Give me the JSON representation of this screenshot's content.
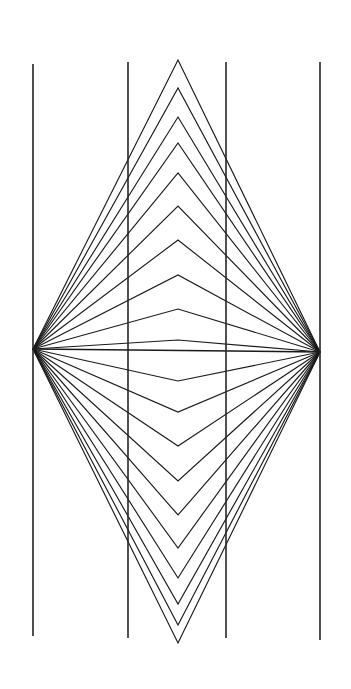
{
  "figure": {
    "background_color": "#ffffff",
    "line_color": "#1a1a1a",
    "vertical_line_color": "#252525",
    "canvas": {
      "width": 351,
      "height": 689
    }
  },
  "chart_data": {
    "type": "line",
    "xlabel": "",
    "ylabel": "",
    "xlim": [
      0,
      351
    ],
    "ylim": [
      0,
      689
    ],
    "grid": false,
    "legend": "none",
    "annotations": [],
    "vertices": {
      "left": {
        "x": 33,
        "y": 349
      },
      "right": {
        "x": 320,
        "y": 352
      },
      "center_axis_x": 178
    },
    "series": [
      {
        "name": "vertical-parallel-lines",
        "type": "segments",
        "stroke": "#252525",
        "stroke_width": 1.6,
        "points": [
          {
            "x1": 33,
            "y1": 64,
            "x2": 33,
            "y2": 636
          },
          {
            "x1": 128,
            "y1": 62,
            "x2": 128,
            "y2": 638
          },
          {
            "x1": 226,
            "y1": 62,
            "x2": 226,
            "y2": 638
          },
          {
            "x1": 320,
            "y1": 62,
            "x2": 320,
            "y2": 640
          }
        ]
      },
      {
        "name": "horizontal-axis-ray",
        "type": "segments",
        "stroke": "#1a1a1a",
        "stroke_width": 1.3,
        "points": [
          {
            "x1": 33,
            "y1": 349,
            "x2": 320,
            "y2": 352
          }
        ]
      },
      {
        "name": "upper-chevrons",
        "type": "polylines",
        "stroke": "#1a1a1a",
        "stroke_width": 1.15,
        "apex_x": 178,
        "apex_y": [
          340,
          309,
          275,
          240,
          206,
          173,
          143,
          117,
          88,
          60
        ],
        "comment": "apex y-coordinates of each nested upward chevron, innermost first"
      },
      {
        "name": "lower-chevrons",
        "type": "polylines",
        "stroke": "#1a1a1a",
        "stroke_width": 1.15,
        "apex_x": 178,
        "apex_y": [
          381,
          412,
          446,
          481,
          515,
          548,
          578,
          604,
          625,
          643
        ],
        "comment": "apex y-coordinates of each nested downward chevron, innermost first"
      }
    ]
  }
}
